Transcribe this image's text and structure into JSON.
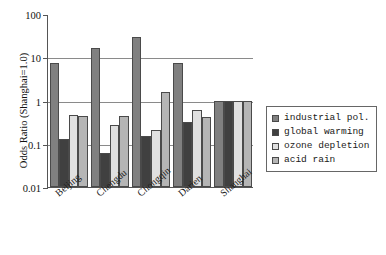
{
  "chart_data": {
    "type": "bar",
    "title": "",
    "xlabel": "",
    "ylabel": "Odds Ratio (Shanghai=1.0)",
    "yscale": "log",
    "ylim": [
      0.01,
      100
    ],
    "ytick_labels": [
      "100",
      "10",
      "1",
      "0.1",
      "0.01"
    ],
    "ytick_values": [
      100,
      10,
      1,
      0.1,
      0.01
    ],
    "grid": "horizontal",
    "legend_position": "right",
    "categories": [
      "Beijing",
      "Chengdu",
      "Chongqin",
      "Darien",
      "Shanghai"
    ],
    "series": [
      {
        "name": "industrial pol.",
        "color": "#808080",
        "values": [
          7.5,
          16.0,
          30.0,
          7.5,
          1.0
        ]
      },
      {
        "name": "global warming",
        "color": "#404040",
        "values": [
          0.13,
          0.06,
          0.15,
          0.32,
          1.0
        ]
      },
      {
        "name": "ozone depletion",
        "color": "#e0e0e0",
        "values": [
          0.47,
          0.27,
          0.21,
          0.6,
          1.0
        ]
      },
      {
        "name": "acid rain",
        "color": "#b5b5b5",
        "values": [
          0.43,
          0.43,
          1.55,
          0.42,
          1.0
        ]
      }
    ]
  },
  "legend": {
    "items": [
      {
        "label": "industrial pol.",
        "color": "#808080"
      },
      {
        "label": "global warming",
        "color": "#404040"
      },
      {
        "label": "ozone depletion",
        "color": "#e0e0e0"
      },
      {
        "label": "acid rain",
        "color": "#b5b5b5"
      }
    ]
  }
}
